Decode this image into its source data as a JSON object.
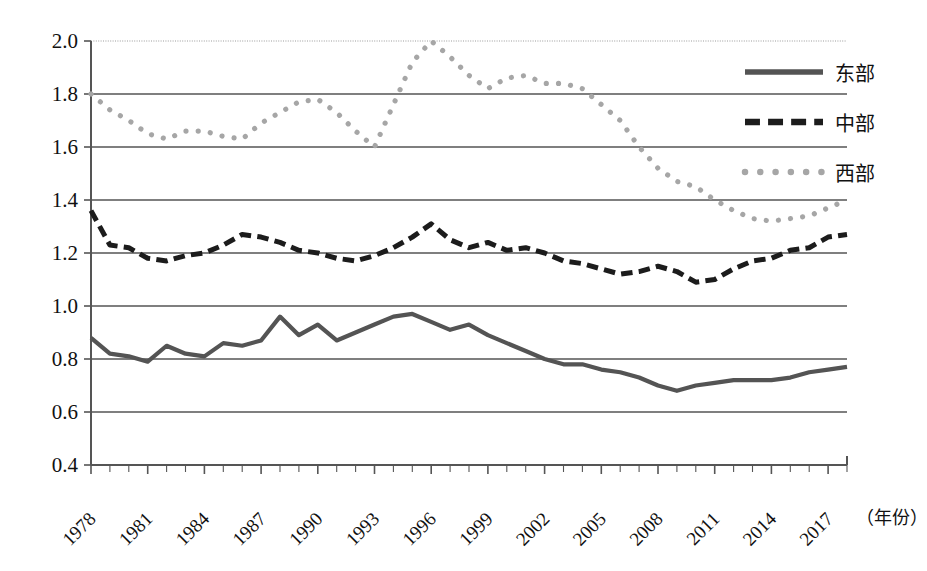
{
  "chart_data": {
    "type": "line",
    "title": "",
    "xlabel": "（年份）",
    "ylabel": "",
    "xlim": [
      1978,
      2018
    ],
    "ylim": [
      0.4,
      2.0
    ],
    "grid": true,
    "legend_position": "top-right",
    "y_ticks": [
      "2.0",
      "1.8",
      "1.6",
      "1.4",
      "1.2",
      "1.0",
      "0.8",
      "0.6",
      "0.4"
    ],
    "y_tick_values": [
      2.0,
      1.8,
      1.6,
      1.4,
      1.2,
      1.0,
      0.8,
      0.6,
      0.4
    ],
    "x_ticks": [
      "1978",
      "1981",
      "1984",
      "1987",
      "1990",
      "1993",
      "1996",
      "1999",
      "2002",
      "2005",
      "2008",
      "2011",
      "2014",
      "2017"
    ],
    "x_tick_values": [
      1978,
      1981,
      1984,
      1987,
      1990,
      1993,
      1996,
      1999,
      2002,
      2005,
      2008,
      2011,
      2014,
      2017
    ],
    "x": [
      1978,
      1979,
      1980,
      1981,
      1982,
      1983,
      1984,
      1985,
      1986,
      1987,
      1988,
      1989,
      1990,
      1991,
      1992,
      1993,
      1994,
      1995,
      1996,
      1997,
      1998,
      1999,
      2000,
      2001,
      2002,
      2003,
      2004,
      2005,
      2006,
      2007,
      2008,
      2009,
      2010,
      2011,
      2012,
      2013,
      2014,
      2015,
      2016,
      2017,
      2018
    ],
    "series": [
      {
        "name": "东部",
        "style": "solid",
        "color": "#545454",
        "values": [
          0.88,
          0.82,
          0.81,
          0.79,
          0.85,
          0.82,
          0.81,
          0.86,
          0.85,
          0.87,
          0.96,
          0.89,
          0.93,
          0.87,
          0.9,
          0.93,
          0.96,
          0.97,
          0.94,
          0.91,
          0.93,
          0.89,
          0.86,
          0.83,
          0.8,
          0.78,
          0.78,
          0.76,
          0.75,
          0.73,
          0.7,
          0.68,
          0.7,
          0.71,
          0.72,
          0.72,
          0.72,
          0.73,
          0.75,
          0.76,
          0.77
        ]
      },
      {
        "name": "中部",
        "style": "dashed",
        "color": "#1c1c1c",
        "values": [
          1.36,
          1.23,
          1.22,
          1.18,
          1.17,
          1.19,
          1.2,
          1.23,
          1.27,
          1.26,
          1.24,
          1.21,
          1.2,
          1.18,
          1.17,
          1.19,
          1.22,
          1.26,
          1.31,
          1.25,
          1.22,
          1.24,
          1.21,
          1.22,
          1.2,
          1.17,
          1.16,
          1.14,
          1.12,
          1.13,
          1.15,
          1.13,
          1.09,
          1.1,
          1.14,
          1.17,
          1.18,
          1.21,
          1.22,
          1.26,
          1.27
        ]
      },
      {
        "name": "西部",
        "style": "dotted",
        "color": "#a6a6a6",
        "values": [
          1.8,
          1.74,
          1.7,
          1.65,
          1.63,
          1.66,
          1.66,
          1.64,
          1.63,
          1.69,
          1.73,
          1.77,
          1.78,
          1.73,
          1.66,
          1.6,
          1.76,
          1.92,
          2.0,
          1.94,
          1.87,
          1.82,
          1.86,
          1.87,
          1.84,
          1.84,
          1.82,
          1.76,
          1.7,
          1.6,
          1.52,
          1.47,
          1.45,
          1.4,
          1.36,
          1.33,
          1.32,
          1.33,
          1.34,
          1.37,
          1.4
        ]
      }
    ],
    "legend": [
      {
        "label": "东部",
        "style": "solid",
        "color": "#545454"
      },
      {
        "label": "中部",
        "style": "dashed",
        "color": "#1c1c1c"
      },
      {
        "label": "西部",
        "style": "dotted",
        "color": "#a6a6a6"
      }
    ]
  },
  "colors": {
    "axis": "#555555",
    "grid": "#4d4d4d",
    "background": "#ffffff",
    "east": "#545454",
    "central": "#1c1c1c",
    "west": "#a6a6a6"
  }
}
